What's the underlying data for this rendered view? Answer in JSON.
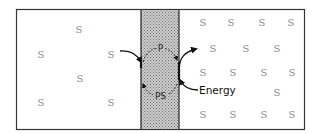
{
  "diagram": {
    "left_compartment": {
      "solutes": [
        {
          "label": "S",
          "x": 79,
          "y": 29
        },
        {
          "label": "S",
          "x": 41,
          "y": 54
        },
        {
          "label": "S",
          "x": 111,
          "y": 54
        },
        {
          "label": "S",
          "x": 80,
          "y": 78
        },
        {
          "label": "S",
          "x": 41,
          "y": 102
        },
        {
          "label": "S",
          "x": 111,
          "y": 102
        }
      ]
    },
    "membrane": {
      "carrier_top_label": "P",
      "carrier_bottom_label": "PS",
      "fill_color": "#b8b8b8"
    },
    "right_compartment": {
      "solutes": [
        {
          "label": "S",
          "x": 203,
          "y": 22
        },
        {
          "label": "S",
          "x": 231,
          "y": 22
        },
        {
          "label": "S",
          "x": 262,
          "y": 22
        },
        {
          "label": "S",
          "x": 291,
          "y": 22
        },
        {
          "label": "S",
          "x": 213,
          "y": 48
        },
        {
          "label": "S",
          "x": 246,
          "y": 48
        },
        {
          "label": "S",
          "x": 277,
          "y": 48
        },
        {
          "label": "S",
          "x": 203,
          "y": 72
        },
        {
          "label": "S",
          "x": 233,
          "y": 72
        },
        {
          "label": "S",
          "x": 264,
          "y": 72
        },
        {
          "label": "S",
          "x": 292,
          "y": 72
        },
        {
          "label": "S",
          "x": 277,
          "y": 92
        },
        {
          "label": "S",
          "x": 203,
          "y": 114
        },
        {
          "label": "S",
          "x": 233,
          "y": 114
        },
        {
          "label": "S",
          "x": 264,
          "y": 114
        },
        {
          "label": "S",
          "x": 292,
          "y": 114
        }
      ]
    },
    "energy_label": "Energy"
  }
}
